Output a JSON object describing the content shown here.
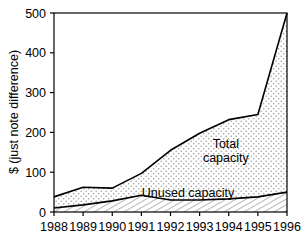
{
  "chart_data": {
    "type": "area",
    "title": "",
    "xlabel": "",
    "ylabel": "$ (just note difference)",
    "categories": [
      "1988",
      "1989",
      "1990",
      "1991",
      "1992",
      "1993",
      "1994",
      "1995",
      "1996"
    ],
    "x": [
      1988,
      1989,
      1990,
      1991,
      1992,
      1993,
      1994,
      1995,
      1996
    ],
    "xlim": [
      1988,
      1996
    ],
    "ylim": [
      0,
      500
    ],
    "yticks": [
      0,
      100,
      200,
      300,
      400,
      500
    ],
    "ytick_labels": [
      "0",
      "100",
      "200",
      "300",
      "400",
      "500"
    ],
    "xtick_labels": [
      "1988",
      "1989",
      "1990",
      "1991",
      "1992",
      "1993",
      "1994",
      "1995",
      "1996"
    ],
    "grid": false,
    "legend_position": "inline-annotations",
    "stacked": false,
    "series": [
      {
        "name": "Total capacity",
        "fill": "dotted",
        "values": [
          38,
          62,
          60,
          97,
          155,
          198,
          232,
          245,
          500
        ]
      },
      {
        "name": "Unused capacity",
        "fill": "hatched-diagonal",
        "values": [
          10,
          18,
          28,
          42,
          30,
          30,
          33,
          38,
          50
        ]
      }
    ],
    "annotations": [
      {
        "text": "Total",
        "x": 1993.9,
        "y": 160
      },
      {
        "text": "capacity",
        "x": 1993.9,
        "y": 125
      },
      {
        "text": "Unused capacity",
        "x": 1992.6,
        "y": 38
      }
    ]
  },
  "colors": {
    "axis": "#000000",
    "line": "#000000",
    "background": "#ffffff",
    "fill_dots": "#8a8a8a",
    "fill_hatch": "#8a8a8a"
  }
}
